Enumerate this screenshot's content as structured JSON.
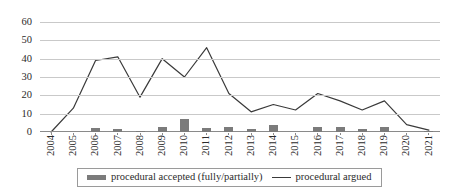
{
  "chart_data": {
    "type": "bar",
    "title": "",
    "subtitle": "",
    "xlabel": "",
    "ylabel": "",
    "categories": [
      "2004",
      "2005",
      "2006",
      "2007",
      "2008",
      "2009",
      "2010",
      "2011",
      "2012",
      "2013",
      "2014",
      "2015",
      "2016",
      "2017",
      "2018",
      "2019",
      "2020",
      "2021"
    ],
    "series": [
      {
        "name": "procedural accepted (fully/partially)",
        "type": "bar",
        "color": "#7b7b7b",
        "values": [
          0,
          0,
          2,
          1.5,
          0.5,
          3,
          7,
          2,
          3,
          1.5,
          4,
          0,
          2.5,
          3,
          1.5,
          2.5,
          0,
          0.5
        ]
      },
      {
        "name": "procedural argued",
        "type": "line",
        "color": "#3a3a3a",
        "values": [
          0,
          13,
          39,
          41,
          19,
          40,
          30,
          46,
          21,
          11,
          15,
          12,
          21,
          17,
          12,
          17,
          4,
          1
        ]
      }
    ],
    "ylim": [
      0,
      60
    ],
    "y_ticks": [
      0,
      10,
      20,
      30,
      40,
      50,
      60
    ],
    "y_tick_labels": [
      "0",
      "10",
      "20",
      "30",
      "40",
      "50",
      "60"
    ],
    "grid": true,
    "grid_axis": "y",
    "legend_position": "bottom",
    "legend": [
      {
        "label": "procedural accepted (fully/partially)",
        "marker": "bar-swatch"
      },
      {
        "label": "procedural argued",
        "marker": "line-swatch"
      }
    ]
  }
}
